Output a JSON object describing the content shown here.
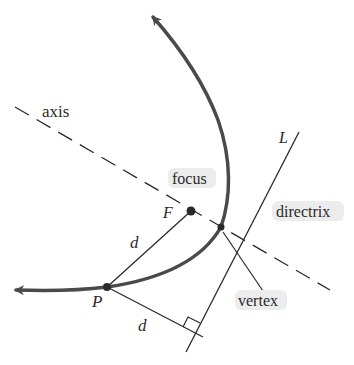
{
  "diagram": {
    "labels": {
      "axis": "axis",
      "focus": "focus",
      "focus_point": "F",
      "directrix": "directrix",
      "directrix_line": "L",
      "vertex": "vertex",
      "point": "P",
      "distance_to_focus": "d",
      "distance_to_directrix": "d"
    },
    "colors": {
      "curve": "#4a4a4a",
      "lines": "#2a2a2a",
      "text": "#2a2a2a",
      "label_highlight": "#d9d9d9"
    }
  }
}
